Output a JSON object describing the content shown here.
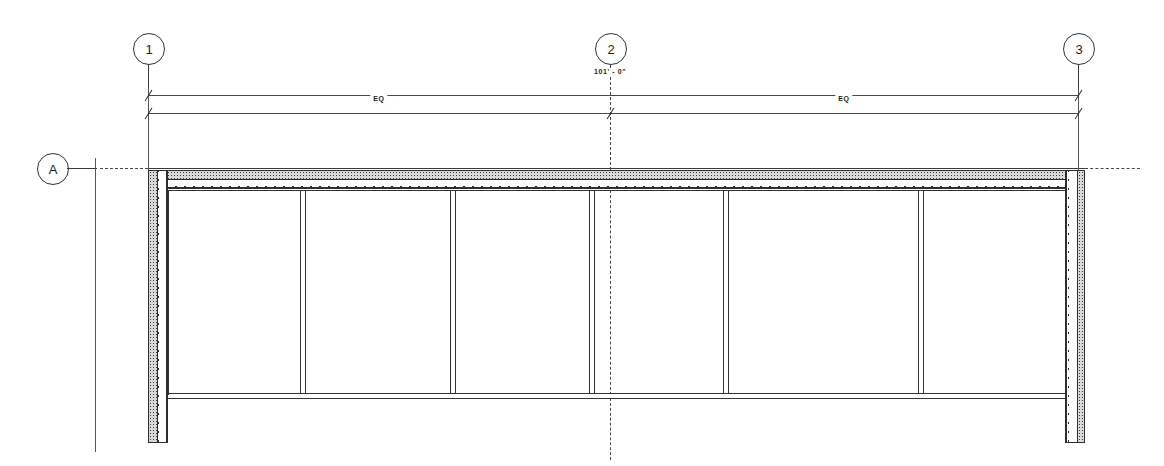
{
  "drawing": {
    "title": "Architectural Floor Plan",
    "background_color": "#ffffff",
    "line_color": "#2e2e2e",
    "width": 1164,
    "height": 466
  },
  "grid_bubbles": [
    {
      "label": "1",
      "axis": "vertical",
      "cx": 148,
      "cy": 48,
      "stem_from": 64,
      "stem_to": 95
    },
    {
      "label": "2",
      "axis": "vertical",
      "cx": 610,
      "cy": 48,
      "stem_from": 64,
      "stem_to": 72
    },
    {
      "label": "3",
      "axis": "vertical",
      "cx": 1078,
      "cy": 48,
      "stem_from": 64,
      "stem_to": 95
    },
    {
      "label": "A",
      "axis": "horizontal",
      "cx": 52,
      "cy": 168,
      "stem_from": 68,
      "stem_to": 96
    }
  ],
  "dimensions": {
    "overall": {
      "label": "101' - 0\"",
      "y": 95,
      "x_start": 148,
      "x_end": 1078,
      "text_x": 610,
      "text_y": 73
    },
    "equal_bays": {
      "y": 113,
      "x_start": 148,
      "x_mid": 610,
      "x_end": 1078,
      "segments": [
        {
          "label": "EQ",
          "text_x": 379,
          "text_y": 96
        },
        {
          "label": "EQ",
          "text_x": 844,
          "text_y": 96
        }
      ]
    }
  },
  "building": {
    "envelope": {
      "left_x": 148,
      "right_x": 1085,
      "top_y": 170,
      "bottom_y": 443,
      "wall_thickness": 20,
      "top_wall_thickness": 18
    },
    "interior_cross_wall": {
      "y": 394,
      "thickness": 5,
      "x_start": 168,
      "x_end": 1065
    },
    "partitions": [
      {
        "x": 300,
        "width": 6,
        "y_top": 188,
        "y_bottom": 394
      },
      {
        "x": 450,
        "width": 6,
        "y_top": 188,
        "y_bottom": 394
      },
      {
        "x": 592,
        "width": 6,
        "y_top": 188,
        "y_bottom": 394
      },
      {
        "x": 723,
        "width": 6,
        "y_top": 188,
        "y_bottom": 394
      },
      {
        "x": 918,
        "width": 6,
        "y_top": 188,
        "y_bottom": 394
      }
    ],
    "bay_count": 6
  },
  "gridlines": {
    "grid_2_vertical": {
      "x": 610,
      "y_start": 72,
      "y_end": 460
    },
    "grid_A_horizontal": {
      "y": 168,
      "x_start": 70,
      "x_end": 1140
    },
    "extension_left": {
      "x": 95,
      "y_start": 168,
      "y_end": 452
    },
    "extension_1": {
      "x": 148,
      "y_start": 95,
      "y_end": 175
    },
    "extension_3": {
      "x": 1078,
      "y_start": 95,
      "y_end": 175
    }
  },
  "hatch_legend": {
    "stipple": "masonry-stipple-hatch",
    "zigzag": "insulation-zigzag-hatch"
  }
}
